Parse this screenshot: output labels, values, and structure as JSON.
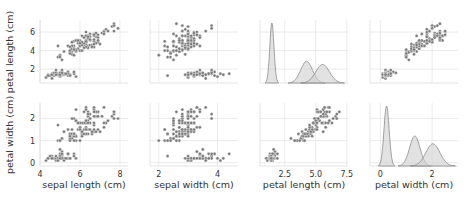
{
  "chart_data": {
    "type": "scatter",
    "title": "",
    "style": "seaborn pairplot (whitegrid), rows = petal length, petal width; cols = sepal length, sepal width, petal length, petal width; diagonal = KDE by class",
    "grid": true,
    "legend": null,
    "marker_color": "#7a7a7a",
    "marker_edge": "#ffffff",
    "kde_fill": "#cfcfcf",
    "kde_line": "#8a8a8a",
    "columns": [
      {
        "label": "sepal length (cm)",
        "xlim": [
          4.0,
          8.4
        ],
        "ticks": [
          4,
          6,
          8
        ]
      },
      {
        "label": "sepal width (cm)",
        "xlim": [
          1.7,
          4.7
        ],
        "ticks": [
          2,
          4
        ]
      },
      {
        "label": "petal length (cm)",
        "xlim": [
          0.5,
          7.6
        ],
        "ticks": [
          2.5,
          5.0,
          7.5
        ],
        "tick_labels": [
          "2.5",
          "5.0",
          "7.5"
        ]
      },
      {
        "label": "petal width (cm)",
        "xlim": [
          -0.4,
          3.0
        ],
        "ticks": [
          0,
          2
        ]
      }
    ],
    "rows": [
      {
        "label": "petal length (cm)",
        "ylim": [
          0.5,
          7.3
        ],
        "ticks": [
          2,
          4,
          6
        ]
      },
      {
        "label": "petal width (cm)",
        "ylim": [
          -0.15,
          2.7
        ],
        "ticks": [
          0,
          1,
          2
        ]
      }
    ],
    "samples": {
      "setosa": [
        [
          5.1,
          3.5,
          1.4,
          0.2
        ],
        [
          4.9,
          3.0,
          1.4,
          0.2
        ],
        [
          4.7,
          3.2,
          1.3,
          0.2
        ],
        [
          4.6,
          3.1,
          1.5,
          0.2
        ],
        [
          5.0,
          3.6,
          1.4,
          0.2
        ],
        [
          5.4,
          3.9,
          1.7,
          0.4
        ],
        [
          4.6,
          3.4,
          1.4,
          0.3
        ],
        [
          5.0,
          3.4,
          1.5,
          0.2
        ],
        [
          4.4,
          2.9,
          1.4,
          0.2
        ],
        [
          4.9,
          3.1,
          1.5,
          0.1
        ],
        [
          5.4,
          3.7,
          1.5,
          0.2
        ],
        [
          4.8,
          3.4,
          1.6,
          0.2
        ],
        [
          4.8,
          3.0,
          1.4,
          0.1
        ],
        [
          4.3,
          3.0,
          1.1,
          0.1
        ],
        [
          5.8,
          4.0,
          1.2,
          0.2
        ],
        [
          5.7,
          4.4,
          1.5,
          0.4
        ],
        [
          5.4,
          3.9,
          1.3,
          0.4
        ],
        [
          5.1,
          3.5,
          1.4,
          0.3
        ],
        [
          5.7,
          3.8,
          1.7,
          0.3
        ],
        [
          5.1,
          3.8,
          1.5,
          0.3
        ],
        [
          5.4,
          3.4,
          1.7,
          0.2
        ],
        [
          5.1,
          3.7,
          1.5,
          0.4
        ],
        [
          4.6,
          3.6,
          1.0,
          0.2
        ],
        [
          5.1,
          3.3,
          1.7,
          0.5
        ],
        [
          4.8,
          3.4,
          1.9,
          0.2
        ],
        [
          5.0,
          3.0,
          1.6,
          0.2
        ],
        [
          5.0,
          3.4,
          1.6,
          0.4
        ],
        [
          5.2,
          3.5,
          1.5,
          0.2
        ],
        [
          5.2,
          3.4,
          1.4,
          0.2
        ],
        [
          4.7,
          3.2,
          1.6,
          0.2
        ],
        [
          4.8,
          3.1,
          1.6,
          0.2
        ],
        [
          5.4,
          3.4,
          1.5,
          0.4
        ],
        [
          5.2,
          4.1,
          1.5,
          0.1
        ],
        [
          5.5,
          4.2,
          1.4,
          0.2
        ],
        [
          4.9,
          3.1,
          1.5,
          0.2
        ],
        [
          5.0,
          3.2,
          1.2,
          0.2
        ],
        [
          5.5,
          3.5,
          1.3,
          0.2
        ],
        [
          4.9,
          3.6,
          1.4,
          0.1
        ],
        [
          4.4,
          3.0,
          1.3,
          0.2
        ],
        [
          5.1,
          3.4,
          1.5,
          0.2
        ],
        [
          5.0,
          3.5,
          1.3,
          0.3
        ],
        [
          4.5,
          2.3,
          1.3,
          0.3
        ],
        [
          4.4,
          3.2,
          1.3,
          0.2
        ],
        [
          5.0,
          3.5,
          1.6,
          0.6
        ],
        [
          5.1,
          3.8,
          1.9,
          0.4
        ],
        [
          4.8,
          3.0,
          1.4,
          0.3
        ],
        [
          5.1,
          3.8,
          1.6,
          0.2
        ],
        [
          4.6,
          3.2,
          1.4,
          0.2
        ],
        [
          5.3,
          3.7,
          1.5,
          0.2
        ],
        [
          5.0,
          3.3,
          1.4,
          0.2
        ]
      ],
      "versicolor": [
        [
          7.0,
          3.2,
          4.7,
          1.4
        ],
        [
          6.4,
          3.2,
          4.5,
          1.5
        ],
        [
          6.9,
          3.1,
          4.9,
          1.5
        ],
        [
          5.5,
          2.3,
          4.0,
          1.3
        ],
        [
          6.5,
          2.8,
          4.6,
          1.5
        ],
        [
          5.7,
          2.8,
          4.5,
          1.3
        ],
        [
          6.3,
          3.3,
          4.7,
          1.6
        ],
        [
          4.9,
          2.4,
          3.3,
          1.0
        ],
        [
          6.6,
          2.9,
          4.6,
          1.3
        ],
        [
          5.2,
          2.7,
          3.9,
          1.4
        ],
        [
          5.0,
          2.0,
          3.5,
          1.0
        ],
        [
          5.9,
          3.0,
          4.2,
          1.5
        ],
        [
          6.0,
          2.2,
          4.0,
          1.0
        ],
        [
          6.1,
          2.9,
          4.7,
          1.4
        ],
        [
          5.6,
          2.9,
          3.6,
          1.3
        ],
        [
          6.7,
          3.1,
          4.4,
          1.4
        ],
        [
          5.6,
          3.0,
          4.5,
          1.5
        ],
        [
          5.8,
          2.7,
          4.1,
          1.0
        ],
        [
          6.2,
          2.2,
          4.5,
          1.5
        ],
        [
          5.6,
          2.5,
          3.9,
          1.1
        ],
        [
          5.9,
          3.2,
          4.8,
          1.8
        ],
        [
          6.1,
          2.8,
          4.0,
          1.3
        ],
        [
          6.3,
          2.5,
          4.9,
          1.5
        ],
        [
          6.1,
          2.8,
          4.7,
          1.2
        ],
        [
          6.4,
          2.9,
          4.3,
          1.3
        ],
        [
          6.6,
          3.0,
          4.4,
          1.4
        ],
        [
          6.8,
          2.8,
          4.8,
          1.4
        ],
        [
          6.7,
          3.0,
          5.0,
          1.7
        ],
        [
          6.0,
          2.9,
          4.5,
          1.5
        ],
        [
          5.7,
          2.6,
          3.5,
          1.0
        ],
        [
          5.5,
          2.4,
          3.8,
          1.1
        ],
        [
          5.5,
          2.4,
          3.7,
          1.0
        ],
        [
          5.8,
          2.7,
          3.9,
          1.2
        ],
        [
          6.0,
          2.7,
          5.1,
          1.6
        ],
        [
          5.4,
          3.0,
          4.5,
          1.5
        ],
        [
          6.0,
          3.4,
          4.5,
          1.6
        ],
        [
          6.7,
          3.1,
          4.7,
          1.5
        ],
        [
          6.3,
          2.3,
          4.4,
          1.3
        ],
        [
          5.6,
          3.0,
          4.1,
          1.3
        ],
        [
          5.5,
          2.5,
          4.0,
          1.3
        ],
        [
          5.5,
          2.6,
          4.4,
          1.2
        ],
        [
          6.1,
          3.0,
          4.6,
          1.4
        ],
        [
          5.8,
          2.6,
          4.0,
          1.2
        ],
        [
          5.0,
          2.3,
          3.3,
          1.0
        ],
        [
          5.6,
          2.7,
          4.2,
          1.3
        ],
        [
          5.7,
          3.0,
          4.2,
          1.2
        ],
        [
          5.7,
          2.9,
          4.2,
          1.3
        ],
        [
          6.2,
          2.9,
          4.3,
          1.3
        ],
        [
          5.1,
          2.5,
          3.0,
          1.1
        ],
        [
          5.7,
          2.8,
          4.1,
          1.3
        ]
      ],
      "virginica": [
        [
          6.3,
          3.3,
          6.0,
          2.5
        ],
        [
          5.8,
          2.7,
          5.1,
          1.9
        ],
        [
          7.1,
          3.0,
          5.9,
          2.1
        ],
        [
          6.3,
          2.9,
          5.6,
          1.8
        ],
        [
          6.5,
          3.0,
          5.8,
          2.2
        ],
        [
          7.6,
          3.0,
          6.6,
          2.1
        ],
        [
          4.9,
          2.5,
          4.5,
          1.7
        ],
        [
          7.3,
          2.9,
          6.3,
          1.8
        ],
        [
          6.7,
          2.5,
          5.8,
          1.8
        ],
        [
          7.2,
          3.6,
          6.1,
          2.5
        ],
        [
          6.5,
          3.2,
          5.1,
          2.0
        ],
        [
          6.4,
          2.7,
          5.3,
          1.9
        ],
        [
          6.8,
          3.0,
          5.5,
          2.1
        ],
        [
          5.7,
          2.5,
          5.0,
          2.0
        ],
        [
          5.8,
          2.8,
          5.1,
          2.4
        ],
        [
          6.4,
          3.2,
          5.3,
          2.3
        ],
        [
          6.5,
          3.0,
          5.5,
          1.8
        ],
        [
          7.7,
          3.8,
          6.7,
          2.2
        ],
        [
          7.7,
          2.6,
          6.9,
          2.3
        ],
        [
          6.0,
          2.2,
          5.0,
          1.5
        ],
        [
          6.9,
          3.2,
          5.7,
          2.3
        ],
        [
          5.6,
          2.8,
          4.9,
          2.0
        ],
        [
          7.7,
          2.8,
          6.7,
          2.0
        ],
        [
          6.3,
          2.7,
          4.9,
          1.8
        ],
        [
          6.7,
          3.3,
          5.7,
          2.1
        ],
        [
          7.2,
          3.2,
          6.0,
          1.8
        ],
        [
          6.2,
          2.8,
          4.8,
          1.8
        ],
        [
          6.1,
          3.0,
          4.9,
          1.8
        ],
        [
          6.4,
          2.8,
          5.6,
          2.1
        ],
        [
          7.2,
          3.0,
          5.8,
          1.6
        ],
        [
          7.4,
          2.8,
          6.1,
          1.9
        ],
        [
          7.9,
          3.8,
          6.4,
          2.0
        ],
        [
          6.4,
          2.8,
          5.6,
          2.2
        ],
        [
          6.3,
          2.8,
          5.1,
          1.5
        ],
        [
          6.1,
          2.6,
          5.6,
          1.4
        ],
        [
          7.7,
          3.0,
          6.1,
          2.3
        ],
        [
          6.3,
          3.4,
          5.6,
          2.4
        ],
        [
          6.4,
          3.1,
          5.5,
          1.8
        ],
        [
          6.0,
          3.0,
          4.8,
          1.8
        ],
        [
          6.9,
          3.1,
          5.4,
          2.1
        ],
        [
          6.7,
          3.1,
          5.6,
          2.4
        ],
        [
          6.9,
          3.1,
          5.1,
          2.3
        ],
        [
          5.8,
          2.7,
          5.1,
          1.9
        ],
        [
          6.8,
          3.2,
          5.9,
          2.3
        ],
        [
          6.7,
          3.3,
          5.7,
          2.5
        ],
        [
          6.7,
          3.0,
          5.2,
          2.3
        ],
        [
          6.3,
          2.5,
          5.0,
          1.9
        ],
        [
          6.5,
          3.0,
          5.2,
          2.0
        ],
        [
          6.2,
          3.4,
          5.4,
          2.3
        ],
        [
          5.9,
          3.0,
          5.1,
          1.8
        ]
      ]
    },
    "kde": {
      "petal_length": [
        {
          "class": "setosa",
          "mean": 1.46,
          "sd": 0.17
        },
        {
          "class": "versicolor",
          "mean": 4.26,
          "sd": 0.47
        },
        {
          "class": "virginica",
          "mean": 5.55,
          "sd": 0.55
        }
      ],
      "petal_width": [
        {
          "class": "setosa",
          "mean": 0.24,
          "sd": 0.1
        },
        {
          "class": "versicolor",
          "mean": 1.33,
          "sd": 0.2
        },
        {
          "class": "virginica",
          "mean": 2.03,
          "sd": 0.27
        }
      ]
    }
  },
  "labels": {
    "row1_ylabel": "petal length (cm)",
    "row2_ylabel": "petal width (cm)",
    "col1_xlabel": "sepal length (cm)",
    "col2_xlabel": "sepal width (cm)",
    "col3_xlabel": "petal length (cm)",
    "col4_xlabel": "petal width (cm)"
  }
}
